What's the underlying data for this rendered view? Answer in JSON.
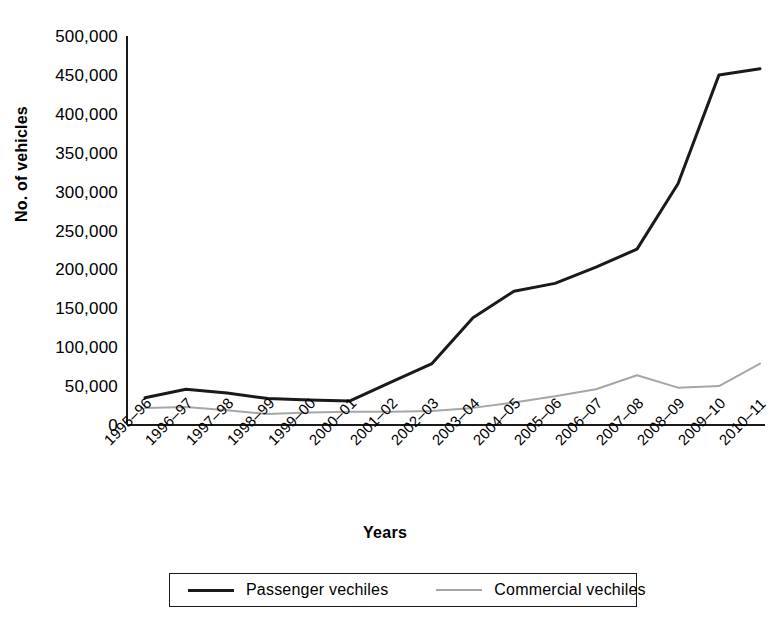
{
  "chart_data": {
    "type": "line",
    "title": "",
    "xlabel": "Years",
    "ylabel": "No. of vehicles",
    "ylim": [
      0,
      500000
    ],
    "ytick_step": 50000,
    "grid": false,
    "legend_position": "bottom",
    "categories": [
      "1995–96",
      "1996–97",
      "1997–98",
      "1998–99",
      "1999–00",
      "2000–01",
      "2001–02",
      "2002–03",
      "2003–04",
      "2004–05",
      "2005–06",
      "2006–07",
      "2007–08",
      "2008–09",
      "2009–10",
      "2010–11"
    ],
    "ytick_labels": [
      "0",
      "50,000",
      "100,000",
      "150,000",
      "200,000",
      "250,000",
      "300,000",
      "350,000",
      "400,000",
      "450,000",
      "500,000"
    ],
    "series": [
      {
        "name": "Passenger vechiles",
        "color": "#1a1a1a",
        "width": 3,
        "values": [
          35000,
          46000,
          41000,
          34000,
          32000,
          31000,
          55000,
          79000,
          138000,
          172000,
          182000,
          203000,
          226000,
          310000,
          450000,
          458000
        ]
      },
      {
        "name": "Commercial vechiles",
        "color": "#a6a6a6",
        "width": 2,
        "values": [
          22000,
          23000,
          19000,
          14000,
          16000,
          17000,
          17000,
          18000,
          22000,
          29000,
          37000,
          46000,
          64000,
          48000,
          50000,
          79000
        ]
      }
    ]
  },
  "axes": {
    "y_title": "No. of vehicles",
    "x_title": "Years"
  },
  "legend": {
    "items": [
      {
        "label": "Passenger vechiles",
        "color": "#1a1a1a"
      },
      {
        "label": "Commercial vechiles",
        "color": "#a6a6a6"
      }
    ]
  }
}
